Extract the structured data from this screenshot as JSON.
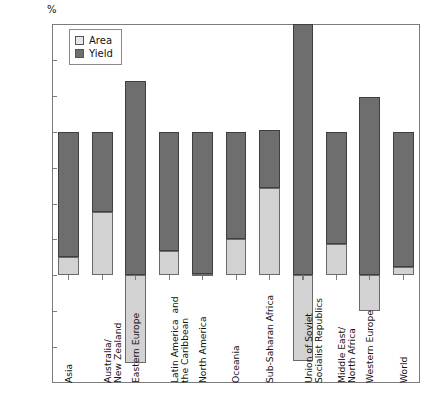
{
  "axis": {
    "unit_label": "%",
    "y_ticks": [
      "175",
      "150",
      "125",
      "100",
      "75",
      "50",
      "25",
      "0",
      "-25",
      "-50",
      "-75"
    ]
  },
  "legend": {
    "items": [
      {
        "label": "Area",
        "color": "#e8e8e8"
      },
      {
        "label": "Yield",
        "color": "#6e6e6e"
      }
    ]
  },
  "chart_data": {
    "type": "bar",
    "title": "",
    "subtitle": "",
    "xlabel": "",
    "ylabel": "%",
    "ylim": [
      -75,
      175
    ],
    "yticks": [
      -75,
      -50,
      -25,
      0,
      25,
      50,
      75,
      100,
      125,
      150,
      175
    ],
    "grid": false,
    "legend_position": "top-left-inside",
    "stacked": true,
    "categories": [
      "Asia",
      "Australia/\nNew Zealand",
      "Eastern Europe",
      "Latin America  and\nthe Caribbean",
      "North America",
      "Oceania",
      "Sub-Saharan Africa",
      "Union of Soviet\nSocialist Republics",
      "Middle East/\nNorth Africa",
      "Western Europe",
      "World"
    ],
    "series": [
      {
        "name": "Area",
        "color": "#d2d2d2",
        "values": [
          13,
          44,
          -61,
          17,
          1,
          25,
          61,
          -60,
          22,
          -25,
          6
        ]
      },
      {
        "name": "Yield",
        "color": "#6e6e6e",
        "values": [
          87,
          56,
          135,
          83,
          99,
          75,
          40,
          175,
          78,
          124,
          94
        ]
      }
    ],
    "totals": [
      100,
      100,
      135,
      100,
      100,
      100,
      101,
      175,
      100,
      124,
      100
    ]
  }
}
